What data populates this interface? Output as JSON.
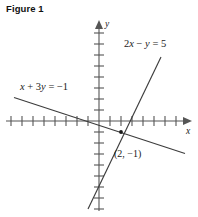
{
  "figure": {
    "title": "Figure 1"
  },
  "axes": {
    "x_label": "x",
    "y_label": "y",
    "origin_px": [
      99,
      121
    ],
    "unit_px": 11,
    "x_ticks_left": 8,
    "x_ticks_right": 7,
    "y_ticks_up": 8,
    "y_ticks_down": 8,
    "grid": false
  },
  "labels": {
    "equation_steep": "2x − y = 5",
    "equation_shallow": "x + 3y = −1",
    "intersection_point": "(2, −1)"
  },
  "colors": {
    "background": "#ffffff",
    "ink": "#1a1a1a",
    "line": "#3c3c3c",
    "axis": "#555555"
  },
  "chart_data": {
    "type": "line",
    "title": "Figure 1",
    "xlabel": "x",
    "ylabel": "y",
    "xlim": [
      -9,
      8
    ],
    "ylim": [
      -9,
      9
    ],
    "grid": false,
    "legend": "inline-annotations",
    "series": [
      {
        "name": "2x − y = 5",
        "label": "2x − y = 5",
        "equation": "2x - y = 5",
        "slope": 2,
        "intercept": -5,
        "x": [
          -1,
          5.6
        ],
        "y": [
          -7,
          6.2
        ]
      },
      {
        "name": "x + 3y = −1",
        "label": "x + 3y = −1",
        "equation": "x + 3y = -1",
        "slope": -0.3333,
        "intercept": -0.3333,
        "x": [
          -7.7,
          7.8
        ],
        "y": [
          2.23,
          -2.93
        ]
      }
    ],
    "annotations": [
      {
        "text": "(2, −1)",
        "x": 2,
        "y": -1,
        "marker": "dot",
        "description": "intersection point of the two lines"
      }
    ]
  }
}
